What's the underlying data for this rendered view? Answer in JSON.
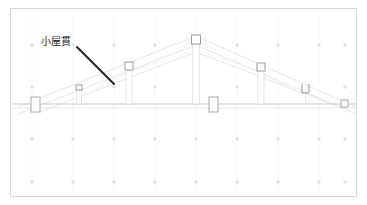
{
  "drawing": {
    "title": "",
    "type": "architectural-section",
    "frame": {
      "border_color": "#d8d8d8",
      "background": "#ffffff",
      "x": 10,
      "y": 8,
      "width": 347,
      "height": 189
    },
    "annotation": {
      "label_text": "小屋貫",
      "label_color": "#1c1c1c",
      "label_x": 41,
      "label_y": 36,
      "leader_line": {
        "color": "#222222",
        "width": 2,
        "x1": 77,
        "y1": 47,
        "x2": 114,
        "y2": 84
      }
    },
    "colors": {
      "grid_tick": "#cfcfd4",
      "faint_line": "#e2e2e6",
      "light_line": "#d2d2d8",
      "member_outline": "#b8b8bf",
      "beam": "#c8c8ce",
      "frame_border": "#d8d8d8"
    },
    "grid": {
      "tick_glyph": "crosshair",
      "tick_size": 4,
      "columns_x": [
        32,
        73,
        114,
        155,
        196,
        237,
        278,
        319,
        345
      ],
      "rows_y": [
        45,
        87,
        139,
        182
      ]
    },
    "ridge": {
      "x": 196,
      "top_y": 40,
      "beam_y": 104
    },
    "members": [
      {
        "name": "ridge-post-cap",
        "kind": "square",
        "x": 196,
        "y": 40,
        "w": 8,
        "h": 8
      },
      {
        "name": "ridge-post-shaft",
        "kind": "post",
        "x": 196,
        "y": 44,
        "w": 6,
        "h": 60
      },
      {
        "name": "left-post-2-cap",
        "kind": "square",
        "x": 129,
        "y": 68,
        "w": 7,
        "h": 7
      },
      {
        "name": "left-post-2",
        "kind": "post",
        "x": 129,
        "y": 71,
        "w": 5,
        "h": 33
      },
      {
        "name": "left-post-1-cap",
        "kind": "square",
        "x": 79,
        "y": 88,
        "w": 6,
        "h": 5
      },
      {
        "name": "left-post-1",
        "kind": "post",
        "x": 79,
        "y": 90,
        "w": 4,
        "h": 14
      },
      {
        "name": "right-post-2-cap",
        "kind": "square",
        "x": 263,
        "y": 68,
        "w": 7,
        "h": 7
      },
      {
        "name": "right-post-2",
        "kind": "post",
        "x": 263,
        "y": 71,
        "w": 5,
        "h": 33
      },
      {
        "name": "right-post-1",
        "kind": "u-bracket",
        "x": 306,
        "y": 87,
        "w": 8,
        "h": 9
      },
      {
        "name": "left-column",
        "kind": "rect",
        "x": 35,
        "y": 100,
        "w": 8,
        "h": 14
      },
      {
        "name": "center-column",
        "kind": "rect",
        "x": 213,
        "y": 100,
        "w": 8,
        "h": 14
      },
      {
        "name": "right-column",
        "kind": "square",
        "x": 346,
        "y": 101,
        "w": 6,
        "h": 6
      }
    ],
    "rafters": [
      {
        "name": "left-upper-rafter",
        "x1": 196,
        "y1": 37,
        "x2": 20,
        "y2": 108
      },
      {
        "name": "right-upper-rafter",
        "x1": 196,
        "y1": 37,
        "x2": 356,
        "y2": 108
      },
      {
        "name": "left-lower-rafter",
        "x1": 196,
        "y1": 44,
        "x2": 20,
        "y2": 113
      },
      {
        "name": "right-lower-rafter",
        "x1": 196,
        "y1": 44,
        "x2": 356,
        "y2": 113
      }
    ],
    "beams": [
      {
        "name": "main-tie-beam",
        "x1": 12,
        "y1": 104,
        "x2": 356,
        "y2": 104
      },
      {
        "name": "lower-tie-beam",
        "x1": 12,
        "y1": 108,
        "x2": 356,
        "y2": 108
      }
    ]
  }
}
